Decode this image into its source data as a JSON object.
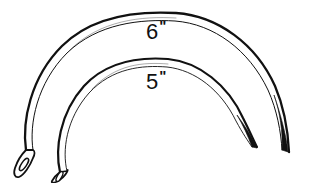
{
  "figure": {
    "background_color": "#ffffff",
    "ink_color": "#111111",
    "width": 309,
    "height": 183
  },
  "labels": [
    {
      "id": "label-6",
      "number": "6",
      "unit": "\"",
      "full_text": "6\"",
      "describes": "large-needle",
      "x": 146,
      "y": 20
    },
    {
      "id": "label-5",
      "number": "5",
      "unit": "\"",
      "full_text": "5\"",
      "describes": "small-needle",
      "x": 146,
      "y": 70
    }
  ],
  "needles": [
    {
      "id": "large-needle",
      "size_label": "6\"",
      "shape": "half-circle curved needle",
      "eye_end": "left",
      "point_end": "right",
      "eye_position": {
        "x": 22,
        "y": 148
      },
      "point_position": {
        "x": 288,
        "y": 152
      },
      "apex_position": {
        "x": 172,
        "y": 13
      }
    },
    {
      "id": "small-needle",
      "size_label": "5\"",
      "shape": "half-circle curved needle",
      "eye_end": "left",
      "point_end": "right",
      "eye_position": {
        "x": 56,
        "y": 168
      },
      "point_position": {
        "x": 256,
        "y": 146
      },
      "apex_position": {
        "x": 163,
        "y": 59
      }
    }
  ]
}
